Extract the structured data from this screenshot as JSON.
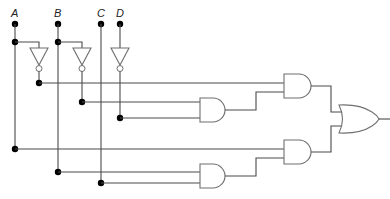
{
  "diagram": {
    "type": "logic-circuit",
    "inputs": [
      {
        "label": "A",
        "x": 15
      },
      {
        "label": "B",
        "x": 58
      },
      {
        "label": "C",
        "x": 101
      },
      {
        "label": "D",
        "x": 120
      }
    ],
    "gates": [
      {
        "id": "not-a",
        "type": "NOT",
        "input": "A"
      },
      {
        "id": "not-b",
        "type": "NOT",
        "input": "B"
      },
      {
        "id": "not-d",
        "type": "NOT",
        "input": "D"
      },
      {
        "id": "and-1",
        "type": "AND",
        "inputs": [
          "B'",
          "D'"
        ]
      },
      {
        "id": "and-2",
        "type": "AND",
        "inputs": [
          "A'",
          "and-1"
        ]
      },
      {
        "id": "and-3",
        "type": "AND",
        "inputs": [
          "B",
          "C"
        ]
      },
      {
        "id": "and-4",
        "type": "AND",
        "inputs": [
          "A",
          "and-3"
        ]
      },
      {
        "id": "or-1",
        "type": "OR",
        "inputs": [
          "and-2",
          "and-4"
        ]
      }
    ],
    "colors": {
      "wire": "#4a4a4a",
      "gate": "#6f6f6f",
      "dot": "#000000"
    }
  }
}
